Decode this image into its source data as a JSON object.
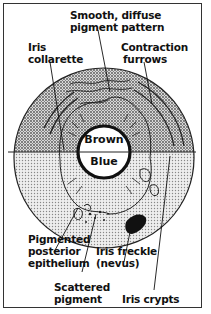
{
  "diagram": {
    "type": "iris anatomy illustration",
    "center_labels": {
      "top": "Brown",
      "bottom": "Blue"
    },
    "labels": [
      {
        "id": "smooth-pattern",
        "lines": [
          "Smooth, diffuse",
          "pigment pattern"
        ]
      },
      {
        "id": "collarette",
        "lines": [
          "Iris",
          "collarette"
        ]
      },
      {
        "id": "contraction",
        "lines": [
          "Contraction",
          "furrows"
        ]
      },
      {
        "id": "posterior",
        "lines": [
          "Pigmented",
          "posterior",
          "epithelium"
        ]
      },
      {
        "id": "freckle",
        "lines": [
          "Iris freckle",
          "(nevus)"
        ]
      },
      {
        "id": "scattered",
        "lines": [
          "Scattered",
          "pigment"
        ]
      },
      {
        "id": "crypts",
        "lines": [
          "Iris crypts"
        ]
      }
    ],
    "colors": {
      "ink": "#111111",
      "brown_stipple": "#a8a8a8",
      "blue_stipple": "#d4d4d4",
      "pupil": "#ffffff",
      "frame": "#333333"
    }
  }
}
